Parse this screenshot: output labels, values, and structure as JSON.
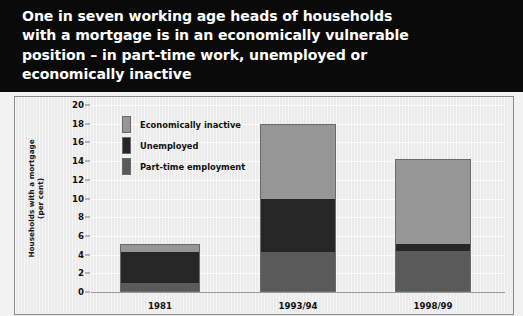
{
  "title": "One in seven working age heads of households\nwith a mortgage is in an economically vulnerable\nposition – in part-time work, unemployed or\neconomically inactive",
  "axis": {
    "y_title": "Households with a mortgage\n(per cent)"
  },
  "legend": {
    "items": [
      {
        "label": "Economically inactive",
        "color": "#969696"
      },
      {
        "label": "Unemployed",
        "color": "#262626"
      },
      {
        "label": "Part-time employment",
        "color": "#5a5a5a"
      }
    ]
  },
  "colors": {
    "banner_background": "#0a0a0a",
    "banner_text": "#ffffff",
    "panel_background": "#ebebeb",
    "gridline": "#fbfbfb",
    "axis_line": "#9a9a9a",
    "bar_outline": "#6b6b6b",
    "economically_inactive": "#969696",
    "unemployed": "#262626",
    "part_time_employment": "#5a5a5a"
  },
  "chart_data": {
    "type": "bar",
    "title": "One in seven working age heads of households with a mortgage is in an economically vulnerable position – in part-time work, unemployed or economically inactive",
    "subtitle": "",
    "stacked": true,
    "xlabel": "",
    "ylabel": "Households with a mortgage (per cent)",
    "ylim": [
      0,
      20
    ],
    "yticks": [
      0,
      2,
      4,
      6,
      8,
      10,
      12,
      14,
      16,
      18,
      20
    ],
    "ytick_labels": [
      "0",
      "2",
      "4",
      "6",
      "8",
      "10",
      "12",
      "14",
      "16",
      "18",
      "20"
    ],
    "grid": true,
    "legend_position": "upper-left-inside",
    "categories": [
      "1981",
      "1993/94",
      "1998/99"
    ],
    "series": [
      {
        "name": "Part-time employment",
        "color": "#5a5a5a",
        "values": [
          1.0,
          4.3,
          4.4
        ]
      },
      {
        "name": "Unemployed",
        "color": "#262626",
        "values": [
          3.3,
          5.7,
          0.7
        ]
      },
      {
        "name": "Economically inactive",
        "color": "#969696",
        "values": [
          0.8,
          8.0,
          9.1
        ]
      }
    ],
    "totals": [
      5.1,
      18.0,
      14.2
    ]
  }
}
